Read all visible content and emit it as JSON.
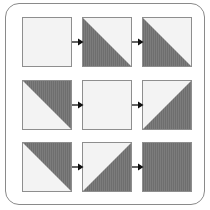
{
  "diagram": {
    "title": "",
    "colors": {
      "light": "#f3f3f3",
      "dark": "#6e6e6e",
      "stripe": "#7c7c7c",
      "border": "#8e8e8e",
      "arrow": "#111111",
      "frame": "#8a8a8a"
    },
    "rows": [
      {
        "cells": [
          "empty",
          "dark-lower-left",
          "dark-lower-left"
        ]
      },
      {
        "cells": [
          "dark-upper-right",
          "empty",
          "dark-lower-right"
        ]
      },
      {
        "cells": [
          "dark-upper-right",
          "dark-lower-right",
          "full"
        ]
      }
    ],
    "arrows_per_row": 2
  }
}
